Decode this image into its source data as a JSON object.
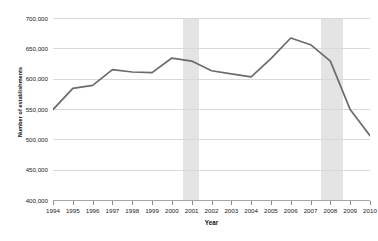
{
  "chart_data": {
    "type": "line",
    "title": "",
    "xlabel": "Year",
    "ylabel": "Number of establishments",
    "x": [
      1994,
      1995,
      1996,
      1997,
      1998,
      1999,
      2000,
      2001,
      2002,
      2003,
      2004,
      2005,
      2006,
      2007,
      2008,
      2009,
      2010
    ],
    "categories": [
      "1994",
      "1995",
      "1996",
      "1997",
      "1998",
      "1999",
      "2000",
      "2001",
      "2002",
      "2003",
      "2004",
      "2005",
      "2006",
      "2007",
      "2008",
      "2009",
      "2010"
    ],
    "values": [
      549000,
      584000,
      589000,
      615000,
      611000,
      610000,
      634000,
      629000,
      613000,
      608000,
      603000,
      633000,
      667000,
      656000,
      629000,
      549000,
      506000
    ],
    "series": [
      {
        "name": "Number of establishments",
        "color": "#6b6b6b",
        "values": [
          549000,
          584000,
          589000,
          615000,
          611000,
          610000,
          634000,
          629000,
          613000,
          608000,
          603000,
          633000,
          667000,
          656000,
          629000,
          549000,
          506000
        ]
      }
    ],
    "ylim": [
      400000,
      700000
    ],
    "xlim": [
      1994,
      2010
    ],
    "ytick_values": [
      400000,
      450000,
      500000,
      550000,
      600000,
      650000,
      700000
    ],
    "ytick_labels": [
      "400,000",
      "450,000",
      "500,000",
      "550,000",
      "600,000",
      "650,000",
      "700,000"
    ],
    "grid": true,
    "legend": "none",
    "annotations": [
      {
        "type": "shaded-band",
        "label": "recession-band-2001",
        "x_start": 2000.55,
        "x_end": 2001.35,
        "color": "#e4e4e4"
      },
      {
        "type": "shaded-band",
        "label": "recession-band-2008",
        "x_start": 2007.55,
        "x_end": 2008.65,
        "color": "#e4e4e4"
      }
    ]
  }
}
